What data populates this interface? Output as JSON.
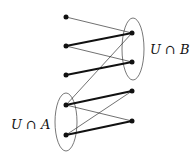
{
  "diagram": {
    "labels": {
      "set_b": "U ∩ B",
      "set_a": "U ∩ A"
    },
    "nodes": [
      {
        "id": "L1",
        "x": 66,
        "y": 17
      },
      {
        "id": "L2",
        "x": 66,
        "y": 46
      },
      {
        "id": "L3",
        "x": 66,
        "y": 75
      },
      {
        "id": "L4",
        "x": 66,
        "y": 105
      },
      {
        "id": "L5",
        "x": 66,
        "y": 135
      },
      {
        "id": "R1",
        "x": 132,
        "y": 33
      },
      {
        "id": "R2",
        "x": 132,
        "y": 62
      },
      {
        "id": "R3",
        "x": 132,
        "y": 91
      },
      {
        "id": "R4",
        "x": 132,
        "y": 121
      }
    ],
    "edges": [
      {
        "from": "L1",
        "to": "R1",
        "weight": "thin"
      },
      {
        "from": "L2",
        "to": "R1",
        "weight": "thick"
      },
      {
        "from": "L2",
        "to": "R2",
        "weight": "thin"
      },
      {
        "from": "L3",
        "to": "R2",
        "weight": "thick"
      },
      {
        "from": "R1",
        "to": "L4",
        "weight": "thin"
      },
      {
        "from": "L4",
        "to": "R3",
        "weight": "thick"
      },
      {
        "from": "L4",
        "to": "R4",
        "weight": "thin"
      },
      {
        "from": "L5",
        "to": "R3",
        "weight": "thin"
      },
      {
        "from": "L5",
        "to": "R4",
        "weight": "thick"
      }
    ],
    "ellipses": [
      {
        "name": "U ∩ B",
        "cx": 133,
        "cy": 49,
        "rx": 11,
        "ry": 31
      },
      {
        "name": "U ∩ A",
        "cx": 66,
        "cy": 122,
        "rx": 11,
        "ry": 29
      }
    ]
  }
}
